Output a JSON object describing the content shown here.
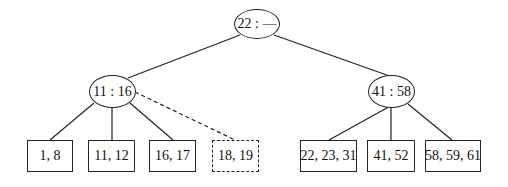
{
  "diagram": {
    "type": "b-tree",
    "root": {
      "label": "22 : —"
    },
    "internal": [
      {
        "id": "left",
        "label": "11 : 16"
      },
      {
        "id": "right",
        "label": "41 : 58"
      }
    ],
    "leaves": [
      {
        "label": "1, 8",
        "parent": "left",
        "style": "solid"
      },
      {
        "label": "11, 12",
        "parent": "left",
        "style": "solid"
      },
      {
        "label": "16, 17",
        "parent": "left",
        "style": "solid"
      },
      {
        "label": "18, 19",
        "parent": "left",
        "style": "dashed"
      },
      {
        "label": "22, 23, 31",
        "parent": "right",
        "style": "solid"
      },
      {
        "label": "41, 52",
        "parent": "right",
        "style": "solid"
      },
      {
        "label": "58, 59, 61",
        "parent": "right",
        "style": "solid"
      }
    ],
    "colors": {
      "stroke": "#222222",
      "background": "#ffffff"
    }
  }
}
